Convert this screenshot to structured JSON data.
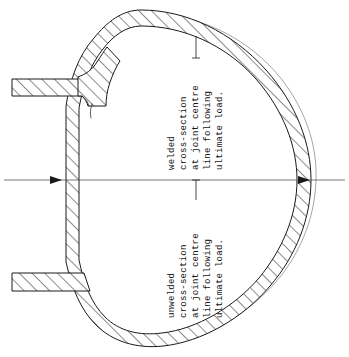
{
  "figure": {
    "background_color": "#ffffff",
    "ink_color": "#1a1a1a",
    "ghost_outline_color": "#8e8e8e",
    "centre_line_color": "#555555",
    "width_px": 349,
    "height_px": 357
  },
  "annotations": {
    "welded": {
      "rotation_deg": -90,
      "lines": [
        "welded",
        "cross-section",
        "at joint centre",
        "line following",
        "ultimate load."
      ],
      "leader_attached_to_line_index": 2
    },
    "unwelded": {
      "rotation_deg": -90,
      "lines": [
        "unwelded",
        "cross-section",
        "at joint centre",
        "line following",
        "ultimate load."
      ],
      "leader_attached_to_line_index": 2
    }
  },
  "parts": {
    "shell": "pressure-vessel-shell",
    "upper_nozzle": "upper-welded-nozzle",
    "lower_nozzle": "lower-unwelded-nozzle",
    "weld_fillet": "weld-fillet",
    "centre_line": "horizontal-centre-line"
  }
}
